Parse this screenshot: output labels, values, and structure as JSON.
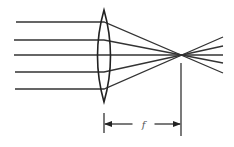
{
  "diagram": {
    "type": "converging-lens-focal-length",
    "colors": {
      "stroke": "#333333",
      "background": "#ffffff"
    },
    "lens": {
      "cx": 104,
      "top": 10,
      "bottom": 102,
      "half_width": 6.5
    },
    "focal_point": {
      "x": 181,
      "y": 55
    },
    "rays": [
      {
        "start_x": 16,
        "y": 22,
        "end": [
          223,
          73
        ]
      },
      {
        "start_x": 14,
        "y": 40,
        "end": [
          223,
          63
        ]
      },
      {
        "start_x": 14,
        "y": 55,
        "end": [
          223,
          55
        ]
      },
      {
        "start_x": 15,
        "y": 72,
        "end": [
          223,
          46
        ]
      },
      {
        "start_x": 15,
        "y": 89,
        "end": [
          223,
          37
        ]
      }
    ],
    "dimension": {
      "label": "f",
      "left_tick_x": 104,
      "right_line_x": 181,
      "arrow_y": 124,
      "tick_top": 113,
      "tick_bottom": 133,
      "right_line_top": 63,
      "right_line_bottom": 136
    }
  }
}
